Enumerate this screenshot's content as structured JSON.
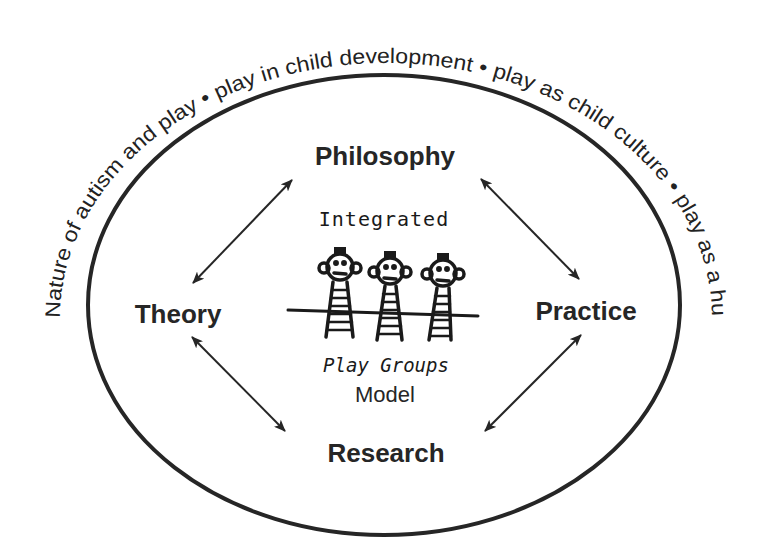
{
  "diagram": {
    "outer_ring_text": "Nature of autism and play • play in child development • play as child culture • play as a human right",
    "outer_ring_segments": [
      "Nature of autism and play",
      "play in child development",
      "play as child culture",
      "play as a human right"
    ],
    "nodes": {
      "top": "Philosophy",
      "left": "Theory",
      "right": "Practice",
      "bottom": "Research"
    },
    "center": {
      "line1": "Integrated",
      "line2": "Play Groups",
      "line3": "Model",
      "illustration": "three-children-holding-hands-drawing"
    },
    "connections": [
      {
        "from": "Philosophy",
        "to": "Theory",
        "type": "bidirectional-arrow"
      },
      {
        "from": "Philosophy",
        "to": "Practice",
        "type": "bidirectional-arrow"
      },
      {
        "from": "Theory",
        "to": "Research",
        "type": "bidirectional-arrow"
      },
      {
        "from": "Practice",
        "to": "Research",
        "type": "bidirectional-arrow"
      }
    ],
    "colors": {
      "ink": "#262626",
      "background": "#ffffff"
    }
  }
}
